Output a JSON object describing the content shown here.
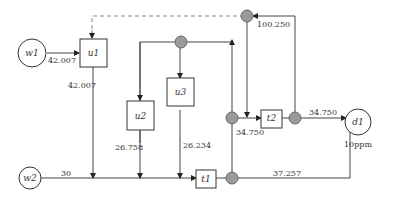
{
  "diagram": {
    "type": "water network superstructure",
    "colors": {
      "line": "#333333",
      "junction_fill": "#9a9a9a",
      "recycle_dashed": "#888888"
    },
    "sources": [
      {
        "id": "w1",
        "label": "w1"
      },
      {
        "id": "w2",
        "label": "w2"
      }
    ],
    "units": [
      {
        "id": "u1",
        "label": "u1"
      },
      {
        "id": "u2",
        "label": "u2"
      },
      {
        "id": "u3",
        "label": "u3"
      }
    ],
    "treatments": [
      {
        "id": "t1",
        "label": "t1"
      },
      {
        "id": "t2",
        "label": "t2"
      }
    ],
    "sinks": [
      {
        "id": "d1",
        "label": "d1",
        "spec": "10ppm"
      }
    ],
    "flows": {
      "w1_to_u1": "42.007",
      "u1_out": "42.007",
      "w2_out": "30",
      "u2_out": "26.758",
      "u3_out": "26.234",
      "t2_in": "34.750",
      "t2_out": "34.750",
      "recycle": "100.250",
      "t1_bypass_to_d1": "37.257"
    }
  }
}
